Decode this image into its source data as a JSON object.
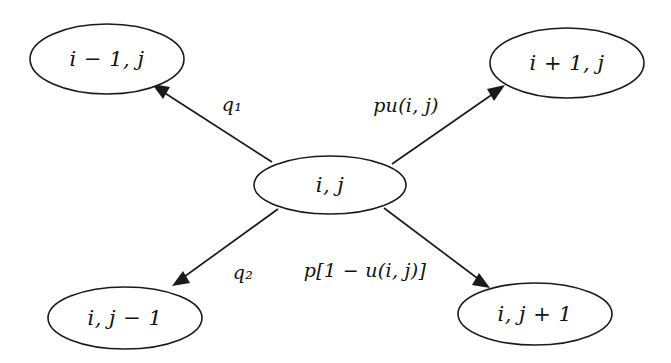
{
  "diagram": {
    "background_color": "#ffffff",
    "stroke_color": "#1a1a1a",
    "text_color": "#111111",
    "nodes": [
      {
        "id": "up_left",
        "label": "i − 1, j",
        "cx": 107,
        "cy": 59,
        "rx": 77,
        "ry": 35
      },
      {
        "id": "up_right",
        "label": "i + 1, j",
        "cx": 567,
        "cy": 63,
        "rx": 77,
        "ry": 35
      },
      {
        "id": "center",
        "label": "i, j",
        "cx": 330,
        "cy": 185,
        "rx": 76,
        "ry": 29
      },
      {
        "id": "low_left",
        "label": "i, j − 1",
        "cx": 125,
        "cy": 318,
        "rx": 77,
        "ry": 31
      },
      {
        "id": "low_right",
        "label": "i, j + 1",
        "cx": 535,
        "cy": 314,
        "rx": 77,
        "ry": 31
      }
    ],
    "edges": [
      {
        "id": "edge_up_left",
        "from": "center",
        "to": "up_left",
        "label": "q₁",
        "label_x": 232,
        "label_y": 106,
        "x1": 272,
        "y1": 162,
        "x2": 152,
        "y2": 84
      },
      {
        "id": "edge_up_right",
        "from": "center",
        "to": "up_right",
        "label": "pu(i, j)",
        "label_x": 406,
        "label_y": 107,
        "x1": 392,
        "y1": 164,
        "x2": 505,
        "y2": 85
      },
      {
        "id": "edge_low_left",
        "from": "center",
        "to": "low_left",
        "label": "q₂",
        "label_x": 243,
        "label_y": 274,
        "x1": 278,
        "y1": 209,
        "x2": 172,
        "y2": 286
      },
      {
        "id": "edge_low_right",
        "from": "center",
        "to": "low_right",
        "label": "p[1 − u(i, j)]",
        "label_x": 365,
        "label_y": 272,
        "x1": 384,
        "y1": 208,
        "x2": 490,
        "y2": 288
      }
    ]
  }
}
